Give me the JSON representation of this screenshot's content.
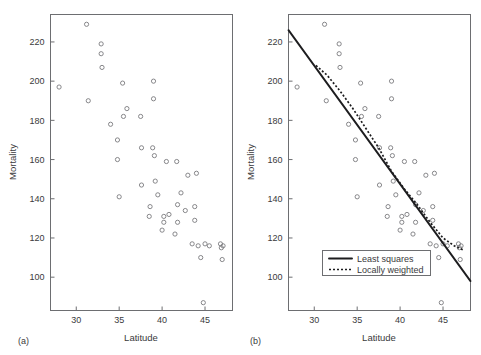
{
  "figure": {
    "caption_a": "(a)",
    "caption_b": "(b)"
  },
  "panel_a": {
    "label": "(a)",
    "xlabel": "Latitude",
    "ylabel": "Mortality",
    "xticks": [
      "30",
      "35",
      "40",
      "45"
    ],
    "yticks": [
      "100",
      "120",
      "140",
      "160",
      "180",
      "200",
      "220"
    ]
  },
  "panel_b": {
    "label": "(b)",
    "xlabel": "Latitude",
    "ylabel": "Mortality",
    "xticks": [
      "30",
      "35",
      "40",
      "45"
    ],
    "yticks": [
      "100",
      "120",
      "140",
      "160",
      "180",
      "200",
      "220"
    ],
    "legend": {
      "items": [
        {
          "label": "Least squares",
          "style": "solid"
        },
        {
          "label": "Locally weighted",
          "style": "dotted"
        }
      ]
    }
  },
  "chart_data": [
    {
      "type": "scatter",
      "panel": "(a)",
      "title": "",
      "xlabel": "Latitude",
      "ylabel": "Mortality",
      "xlim": [
        27.0,
        48.2
      ],
      "ylim": [
        83,
        234
      ],
      "xticks": [
        30,
        35,
        40,
        45
      ],
      "yticks": [
        100,
        120,
        140,
        160,
        180,
        200,
        220
      ],
      "grid": false,
      "marker": "open-circle",
      "points": [
        [
          28.0,
          197.0
        ],
        [
          31.2,
          229.0
        ],
        [
          31.4,
          190.0
        ],
        [
          32.9,
          219.0
        ],
        [
          32.9,
          214.0
        ],
        [
          33.0,
          207.0
        ],
        [
          34.0,
          178.0
        ],
        [
          34.8,
          170.0
        ],
        [
          34.8,
          160.0
        ],
        [
          35.0,
          141.0
        ],
        [
          35.4,
          199.0
        ],
        [
          35.5,
          182.0
        ],
        [
          35.9,
          186.0
        ],
        [
          37.5,
          182.0
        ],
        [
          37.6,
          166.0
        ],
        [
          37.6,
          147.0
        ],
        [
          38.5,
          131.0
        ],
        [
          38.6,
          136.0
        ],
        [
          38.9,
          166.0
        ],
        [
          39.0,
          200.0
        ],
        [
          39.0,
          191.0
        ],
        [
          39.1,
          162.0
        ],
        [
          39.2,
          149.0
        ],
        [
          39.5,
          142.0
        ],
        [
          40.0,
          124.0
        ],
        [
          40.2,
          128.0
        ],
        [
          40.2,
          131.0
        ],
        [
          40.5,
          159.0
        ],
        [
          40.8,
          132.0
        ],
        [
          41.5,
          122.0
        ],
        [
          41.7,
          159.0
        ],
        [
          41.8,
          137.0
        ],
        [
          41.8,
          128.0
        ],
        [
          42.2,
          143.0
        ],
        [
          42.7,
          134.0
        ],
        [
          43.0,
          152.0
        ],
        [
          43.5,
          117.0
        ],
        [
          43.8,
          136.0
        ],
        [
          43.8,
          129.0
        ],
        [
          44.0,
          153.0
        ],
        [
          44.2,
          116.0
        ],
        [
          44.5,
          110.0
        ],
        [
          44.8,
          87.0
        ],
        [
          45.0,
          117.0
        ],
        [
          45.5,
          116.0
        ],
        [
          46.8,
          117.0
        ],
        [
          46.9,
          115.0
        ],
        [
          47.0,
          109.0
        ],
        [
          47.1,
          116.0
        ]
      ]
    },
    {
      "type": "scatter",
      "panel": "(b)",
      "title": "",
      "xlabel": "Latitude",
      "ylabel": "Mortality",
      "xlim": [
        27.0,
        48.2
      ],
      "ylim": [
        83,
        234
      ],
      "xticks": [
        30,
        35,
        40,
        45
      ],
      "yticks": [
        100,
        120,
        140,
        160,
        180,
        200,
        220
      ],
      "grid": false,
      "marker": "open-circle",
      "points": [
        [
          28.0,
          197.0
        ],
        [
          31.2,
          229.0
        ],
        [
          31.4,
          190.0
        ],
        [
          32.9,
          219.0
        ],
        [
          32.9,
          214.0
        ],
        [
          33.0,
          207.0
        ],
        [
          34.0,
          178.0
        ],
        [
          34.8,
          170.0
        ],
        [
          34.8,
          160.0
        ],
        [
          35.0,
          141.0
        ],
        [
          35.4,
          199.0
        ],
        [
          35.5,
          182.0
        ],
        [
          35.9,
          186.0
        ],
        [
          37.5,
          182.0
        ],
        [
          37.6,
          166.0
        ],
        [
          37.6,
          147.0
        ],
        [
          38.5,
          131.0
        ],
        [
          38.6,
          136.0
        ],
        [
          38.9,
          166.0
        ],
        [
          39.0,
          200.0
        ],
        [
          39.0,
          191.0
        ],
        [
          39.1,
          162.0
        ],
        [
          39.2,
          149.0
        ],
        [
          39.5,
          142.0
        ],
        [
          40.0,
          124.0
        ],
        [
          40.2,
          128.0
        ],
        [
          40.2,
          131.0
        ],
        [
          40.5,
          159.0
        ],
        [
          40.8,
          132.0
        ],
        [
          41.5,
          122.0
        ],
        [
          41.7,
          159.0
        ],
        [
          41.8,
          137.0
        ],
        [
          41.8,
          128.0
        ],
        [
          42.2,
          143.0
        ],
        [
          42.7,
          134.0
        ],
        [
          43.0,
          152.0
        ],
        [
          43.5,
          117.0
        ],
        [
          43.8,
          136.0
        ],
        [
          43.8,
          129.0
        ],
        [
          44.0,
          153.0
        ],
        [
          44.2,
          116.0
        ],
        [
          44.5,
          110.0
        ],
        [
          44.8,
          87.0
        ],
        [
          45.0,
          117.0
        ],
        [
          45.5,
          116.0
        ],
        [
          46.8,
          117.0
        ],
        [
          46.9,
          115.0
        ],
        [
          47.0,
          109.0
        ],
        [
          47.1,
          116.0
        ]
      ],
      "series": [
        {
          "name": "Least squares",
          "style": "solid",
          "x": [
            27.0,
            48.2
          ],
          "values": [
            226.0,
            98.0
          ]
        },
        {
          "name": "Locally weighted",
          "style": "dotted",
          "x": [
            30.2,
            31.5,
            33.0,
            34.5,
            36.0,
            37.5,
            39.0,
            40.5,
            42.0,
            43.5,
            45.0,
            46.3,
            47.3
          ],
          "values": [
            208.0,
            203.0,
            195.0,
            186.0,
            176.0,
            166.0,
            154.0,
            145.0,
            137.0,
            128.0,
            120.0,
            116.0,
            114.0
          ]
        }
      ],
      "legend": {
        "position": "bottom-left-inside",
        "entries": [
          "Least squares",
          "Locally weighted"
        ]
      }
    }
  ]
}
